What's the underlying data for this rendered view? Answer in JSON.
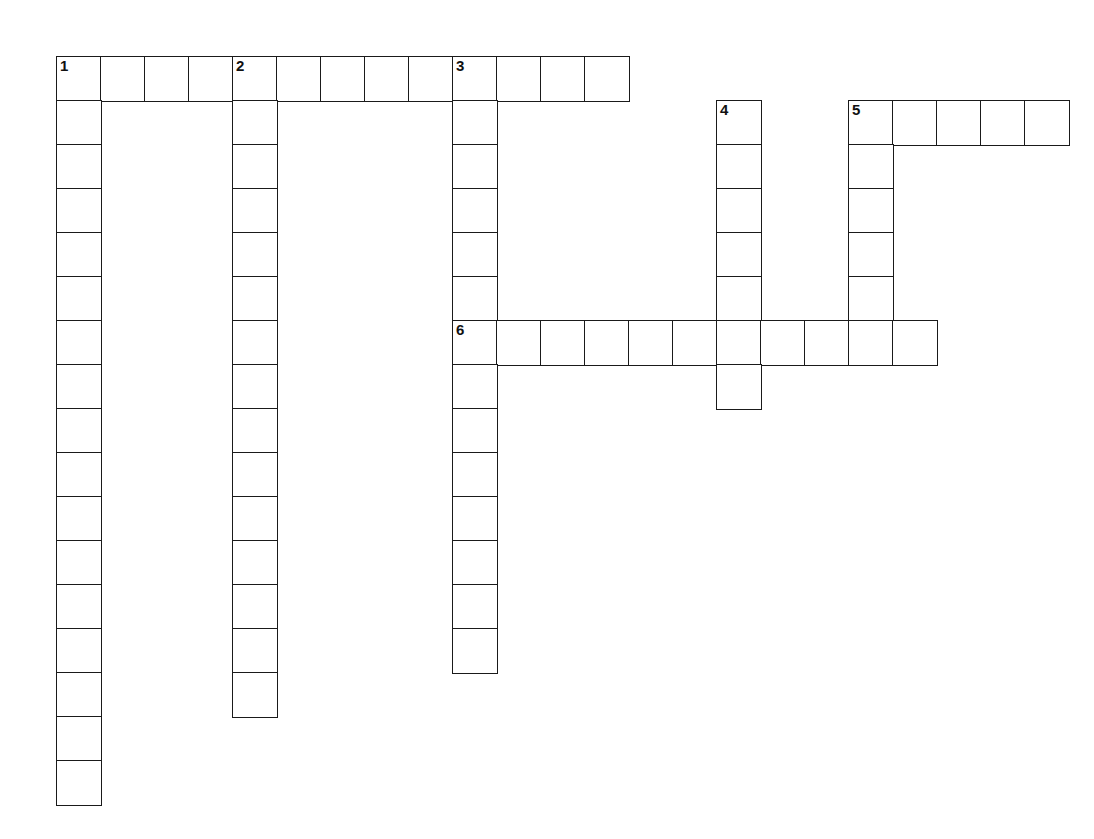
{
  "puzzle": {
    "kind": "crossword-grid",
    "title": "Crossword Puzzle Grid",
    "background_color": "#ffffff",
    "cell_border_color": "#1a1a1a",
    "cell_fill_color": "#ffffff",
    "number_color": "#111111",
    "cell_size": 44,
    "origin_x": 56,
    "origin_y": 56,
    "grid_columns": 23,
    "grid_rows": 17,
    "entries": [
      {
        "number": "1",
        "direction": "across",
        "row": 1,
        "col": 0,
        "length": 13,
        "label": "1 Across"
      },
      {
        "number": "1",
        "direction": "down",
        "row": 1,
        "col": 0,
        "length": 17,
        "label": "1 Down"
      },
      {
        "number": "2",
        "direction": "down",
        "row": 1,
        "col": 4,
        "length": 15,
        "label": "2 Down"
      },
      {
        "number": "3",
        "direction": "down",
        "row": 1,
        "col": 9,
        "length": 14,
        "label": "3 Down"
      },
      {
        "number": "4",
        "direction": "down",
        "row": 2,
        "col": 15,
        "length": 7,
        "label": "4 Down"
      },
      {
        "number": "5",
        "direction": "across",
        "row": 2,
        "col": 18,
        "length": 5,
        "label": "5 Across"
      },
      {
        "number": "5",
        "direction": "down",
        "row": 2,
        "col": 18,
        "length": 6,
        "label": "5 Down"
      },
      {
        "number": "6",
        "direction": "across",
        "row": 7,
        "col": 9,
        "length": 11,
        "label": "6 Across"
      }
    ],
    "numbered_cells": [
      {
        "number": "1",
        "row": 1,
        "col": 0
      },
      {
        "number": "2",
        "row": 1,
        "col": 4
      },
      {
        "number": "3",
        "row": 1,
        "col": 9
      },
      {
        "number": "4",
        "row": 2,
        "col": 15
      },
      {
        "number": "5",
        "row": 2,
        "col": 18
      },
      {
        "number": "6",
        "row": 7,
        "col": 9
      }
    ],
    "cells": [
      {
        "row": 1,
        "col": 0,
        "number": "1",
        "letter": ""
      },
      {
        "row": 1,
        "col": 1,
        "number": "",
        "letter": ""
      },
      {
        "row": 1,
        "col": 2,
        "number": "",
        "letter": ""
      },
      {
        "row": 1,
        "col": 3,
        "number": "",
        "letter": ""
      },
      {
        "row": 1,
        "col": 4,
        "number": "2",
        "letter": ""
      },
      {
        "row": 1,
        "col": 5,
        "number": "",
        "letter": ""
      },
      {
        "row": 1,
        "col": 6,
        "number": "",
        "letter": ""
      },
      {
        "row": 1,
        "col": 7,
        "number": "",
        "letter": ""
      },
      {
        "row": 1,
        "col": 8,
        "number": "",
        "letter": ""
      },
      {
        "row": 1,
        "col": 9,
        "number": "3",
        "letter": ""
      },
      {
        "row": 1,
        "col": 10,
        "number": "",
        "letter": ""
      },
      {
        "row": 1,
        "col": 11,
        "number": "",
        "letter": ""
      },
      {
        "row": 1,
        "col": 12,
        "number": "",
        "letter": ""
      },
      {
        "row": 2,
        "col": 0,
        "number": "",
        "letter": ""
      },
      {
        "row": 2,
        "col": 4,
        "number": "",
        "letter": ""
      },
      {
        "row": 2,
        "col": 9,
        "number": "",
        "letter": ""
      },
      {
        "row": 2,
        "col": 15,
        "number": "4",
        "letter": ""
      },
      {
        "row": 2,
        "col": 18,
        "number": "5",
        "letter": ""
      },
      {
        "row": 2,
        "col": 19,
        "number": "",
        "letter": ""
      },
      {
        "row": 2,
        "col": 20,
        "number": "",
        "letter": ""
      },
      {
        "row": 2,
        "col": 21,
        "number": "",
        "letter": ""
      },
      {
        "row": 2,
        "col": 22,
        "number": "",
        "letter": ""
      },
      {
        "row": 3,
        "col": 0,
        "number": "",
        "letter": ""
      },
      {
        "row": 3,
        "col": 4,
        "number": "",
        "letter": ""
      },
      {
        "row": 3,
        "col": 9,
        "number": "",
        "letter": ""
      },
      {
        "row": 3,
        "col": 15,
        "number": "",
        "letter": ""
      },
      {
        "row": 3,
        "col": 18,
        "number": "",
        "letter": ""
      },
      {
        "row": 4,
        "col": 0,
        "number": "",
        "letter": ""
      },
      {
        "row": 4,
        "col": 4,
        "number": "",
        "letter": ""
      },
      {
        "row": 4,
        "col": 9,
        "number": "",
        "letter": ""
      },
      {
        "row": 4,
        "col": 15,
        "number": "",
        "letter": ""
      },
      {
        "row": 4,
        "col": 18,
        "number": "",
        "letter": ""
      },
      {
        "row": 5,
        "col": 0,
        "number": "",
        "letter": ""
      },
      {
        "row": 5,
        "col": 4,
        "number": "",
        "letter": ""
      },
      {
        "row": 5,
        "col": 9,
        "number": "",
        "letter": ""
      },
      {
        "row": 5,
        "col": 15,
        "number": "",
        "letter": ""
      },
      {
        "row": 5,
        "col": 18,
        "number": "",
        "letter": ""
      },
      {
        "row": 6,
        "col": 0,
        "number": "",
        "letter": ""
      },
      {
        "row": 6,
        "col": 4,
        "number": "",
        "letter": ""
      },
      {
        "row": 6,
        "col": 9,
        "number": "",
        "letter": ""
      },
      {
        "row": 6,
        "col": 15,
        "number": "",
        "letter": ""
      },
      {
        "row": 6,
        "col": 18,
        "number": "",
        "letter": ""
      },
      {
        "row": 7,
        "col": 0,
        "number": "",
        "letter": ""
      },
      {
        "row": 7,
        "col": 4,
        "number": "",
        "letter": ""
      },
      {
        "row": 7,
        "col": 9,
        "number": "6",
        "letter": ""
      },
      {
        "row": 7,
        "col": 10,
        "number": "",
        "letter": ""
      },
      {
        "row": 7,
        "col": 11,
        "number": "",
        "letter": ""
      },
      {
        "row": 7,
        "col": 12,
        "number": "",
        "letter": ""
      },
      {
        "row": 7,
        "col": 13,
        "number": "",
        "letter": ""
      },
      {
        "row": 7,
        "col": 14,
        "number": "",
        "letter": ""
      },
      {
        "row": 7,
        "col": 15,
        "number": "",
        "letter": ""
      },
      {
        "row": 7,
        "col": 16,
        "number": "",
        "letter": ""
      },
      {
        "row": 7,
        "col": 17,
        "number": "",
        "letter": ""
      },
      {
        "row": 7,
        "col": 18,
        "number": "",
        "letter": ""
      },
      {
        "row": 7,
        "col": 19,
        "number": "",
        "letter": ""
      },
      {
        "row": 8,
        "col": 0,
        "number": "",
        "letter": ""
      },
      {
        "row": 8,
        "col": 4,
        "number": "",
        "letter": ""
      },
      {
        "row": 8,
        "col": 9,
        "number": "",
        "letter": ""
      },
      {
        "row": 8,
        "col": 15,
        "number": "",
        "letter": ""
      },
      {
        "row": 9,
        "col": 0,
        "number": "",
        "letter": ""
      },
      {
        "row": 9,
        "col": 4,
        "number": "",
        "letter": ""
      },
      {
        "row": 9,
        "col": 9,
        "number": "",
        "letter": ""
      },
      {
        "row": 10,
        "col": 0,
        "number": "",
        "letter": ""
      },
      {
        "row": 10,
        "col": 4,
        "number": "",
        "letter": ""
      },
      {
        "row": 10,
        "col": 9,
        "number": "",
        "letter": ""
      },
      {
        "row": 11,
        "col": 0,
        "number": "",
        "letter": ""
      },
      {
        "row": 11,
        "col": 4,
        "number": "",
        "letter": ""
      },
      {
        "row": 11,
        "col": 9,
        "number": "",
        "letter": ""
      },
      {
        "row": 12,
        "col": 0,
        "number": "",
        "letter": ""
      },
      {
        "row": 12,
        "col": 4,
        "number": "",
        "letter": ""
      },
      {
        "row": 12,
        "col": 9,
        "number": "",
        "letter": ""
      },
      {
        "row": 13,
        "col": 0,
        "number": "",
        "letter": ""
      },
      {
        "row": 13,
        "col": 4,
        "number": "",
        "letter": ""
      },
      {
        "row": 13,
        "col": 9,
        "number": "",
        "letter": ""
      },
      {
        "row": 14,
        "col": 0,
        "number": "",
        "letter": ""
      },
      {
        "row": 14,
        "col": 4,
        "number": "",
        "letter": ""
      },
      {
        "row": 14,
        "col": 9,
        "number": "",
        "letter": ""
      },
      {
        "row": 15,
        "col": 0,
        "number": "",
        "letter": ""
      },
      {
        "row": 15,
        "col": 4,
        "number": "",
        "letter": ""
      },
      {
        "row": 16,
        "col": 0,
        "number": "",
        "letter": ""
      },
      {
        "row": 17,
        "col": 0,
        "number": "",
        "letter": ""
      }
    ]
  }
}
